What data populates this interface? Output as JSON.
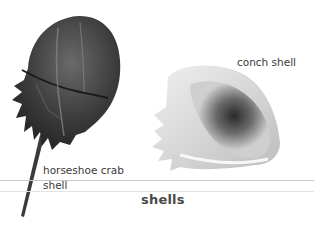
{
  "page": {
    "title": "shells"
  },
  "specimens": [
    {
      "label_line1": "horseshoe crab",
      "label_line2": "shell",
      "image": "horseshoe-crab-shell-illustration"
    },
    {
      "label_line1": "conch shell",
      "image": "conch-shell-illustration"
    }
  ],
  "colors": {
    "background": "#ffffff",
    "text": "#3a3a3a",
    "rule": "#c8c8c8",
    "crab_dark": "#2e2e2e",
    "crab_mid": "#5a5a5a",
    "conch_light": "#e6e6e6",
    "conch_shadow": "#3c3c3c"
  }
}
